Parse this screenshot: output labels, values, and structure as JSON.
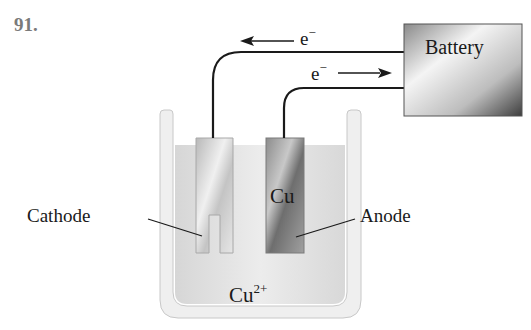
{
  "question": {
    "number": "91."
  },
  "diagram": {
    "battery": {
      "label": "Battery"
    },
    "electron_flow": [
      {
        "label": "e",
        "charge": "−",
        "direction": "left",
        "wire": "top"
      },
      {
        "label": "e",
        "charge": "−",
        "direction": "right",
        "wire": "bottom"
      }
    ],
    "electrodes": {
      "cathode": {
        "label": "Cathode"
      },
      "anode": {
        "label": "Anode",
        "material": "Cu"
      }
    },
    "solution": {
      "ion": "Cu",
      "charge": "2+"
    },
    "colors": {
      "wire": "#1a1a1a",
      "solution": "#dcdcdc",
      "container": "#e8e8e8",
      "battery_dark": "#4a4a4a",
      "battery_light": "#f2f2f2"
    }
  }
}
